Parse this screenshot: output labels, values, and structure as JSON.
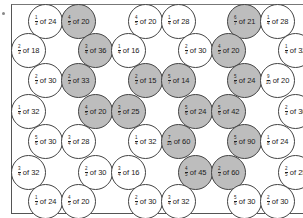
{
  "colors": {
    "shaded": "#bdbdbd",
    "border": "#444444",
    "text": "#222222"
  },
  "circles": [
    {
      "num": "1",
      "den": "3",
      "of": "of 24",
      "x": 28,
      "y": 4,
      "shaded": false
    },
    {
      "num": "4",
      "den": "5",
      "of": "of 20",
      "x": 61,
      "y": 4,
      "shaded": true
    },
    {
      "num": "4",
      "den": "5",
      "of": "of 20",
      "x": 128,
      "y": 4,
      "shaded": false
    },
    {
      "num": "1",
      "den": "4",
      "of": "of 28",
      "x": 161,
      "y": 4,
      "shaded": false
    },
    {
      "num": "6",
      "den": "7",
      "of": "of 21",
      "x": 227,
      "y": 4,
      "shaded": true
    },
    {
      "num": "1",
      "den": "4",
      "of": "of 28",
      "x": 260,
      "y": 4,
      "shaded": false
    },
    {
      "num": "2",
      "den": "3",
      "of": "of 18",
      "x": 11,
      "y": 33,
      "shaded": false
    },
    {
      "num": "3",
      "den": "4",
      "of": "of 36",
      "x": 78,
      "y": 33,
      "shaded": true
    },
    {
      "num": "1",
      "den": "4",
      "of": "of 16",
      "x": 111,
      "y": 33,
      "shaded": false
    },
    {
      "num": "2",
      "den": "3",
      "of": "of 30",
      "x": 178,
      "y": 33,
      "shaded": false
    },
    {
      "num": "4",
      "den": "5",
      "of": "of 20",
      "x": 211,
      "y": 33,
      "shaded": true
    },
    {
      "num": "1",
      "den": "4",
      "of": "of 32",
      "x": 278,
      "y": 33,
      "shaded": false
    },
    {
      "num": "2",
      "den": "3",
      "of": "of 30",
      "x": 28,
      "y": 63,
      "shaded": false
    },
    {
      "num": "2",
      "den": "3",
      "of": "of 33",
      "x": 61,
      "y": 63,
      "shaded": true
    },
    {
      "num": "2",
      "den": "3",
      "of": "of 15",
      "x": 128,
      "y": 63,
      "shaded": true
    },
    {
      "num": "5",
      "den": "7",
      "of": "of 14",
      "x": 161,
      "y": 63,
      "shaded": true
    },
    {
      "num": "5",
      "den": "6",
      "of": "of 24",
      "x": 227,
      "y": 63,
      "shaded": true
    },
    {
      "num": "9",
      "den": "10",
      "of": "of 20",
      "x": 260,
      "y": 63,
      "shaded": false
    },
    {
      "num": "1",
      "den": "4",
      "of": "of 32",
      "x": 11,
      "y": 94,
      "shaded": false
    },
    {
      "num": "4",
      "den": "5",
      "of": "of 20",
      "x": 78,
      "y": 94,
      "shaded": true
    },
    {
      "num": "3",
      "den": "5",
      "of": "of 25",
      "x": 111,
      "y": 94,
      "shaded": true
    },
    {
      "num": "5",
      "den": "6",
      "of": "of 24",
      "x": 178,
      "y": 94,
      "shaded": true
    },
    {
      "num": "5",
      "den": "6",
      "of": "of 42",
      "x": 211,
      "y": 94,
      "shaded": true
    },
    {
      "num": "2",
      "den": "3",
      "of": "of 30",
      "x": 278,
      "y": 94,
      "shaded": false
    },
    {
      "num": "5",
      "den": "6",
      "of": "of 30",
      "x": 28,
      "y": 124,
      "shaded": false
    },
    {
      "num": "3",
      "den": "4",
      "of": "of 28",
      "x": 61,
      "y": 124,
      "shaded": false
    },
    {
      "num": "1",
      "den": "4",
      "of": "of 32",
      "x": 128,
      "y": 124,
      "shaded": false
    },
    {
      "num": "7",
      "den": "10",
      "of": "of 60",
      "x": 161,
      "y": 124,
      "shaded": true
    },
    {
      "num": "5",
      "den": "6",
      "of": "of 90",
      "x": 227,
      "y": 124,
      "shaded": true
    },
    {
      "num": "1",
      "den": "8",
      "of": "of 24",
      "x": 260,
      "y": 124,
      "shaded": false
    },
    {
      "num": "3",
      "den": "4",
      "of": "of 32",
      "x": 11,
      "y": 155,
      "shaded": false
    },
    {
      "num": "2",
      "den": "3",
      "of": "of 30",
      "x": 78,
      "y": 155,
      "shaded": false
    },
    {
      "num": "3",
      "den": "4",
      "of": "of 16",
      "x": 111,
      "y": 155,
      "shaded": false
    },
    {
      "num": "4",
      "den": "5",
      "of": "of 45",
      "x": 178,
      "y": 155,
      "shaded": true
    },
    {
      "num": "2",
      "den": "3",
      "of": "of 60",
      "x": 211,
      "y": 155,
      "shaded": true
    },
    {
      "num": "2",
      "den": "5",
      "of": "of 25",
      "x": 278,
      "y": 155,
      "shaded": false
    },
    {
      "num": "1",
      "den": "3",
      "of": "of 24",
      "x": 28,
      "y": 184,
      "shaded": false
    },
    {
      "num": "4",
      "den": "5",
      "of": "of 20",
      "x": 61,
      "y": 184,
      "shaded": false
    },
    {
      "num": "2",
      "den": "3",
      "of": "of 30",
      "x": 128,
      "y": 184,
      "shaded": false
    },
    {
      "num": "3",
      "den": "4",
      "of": "of 32",
      "x": 161,
      "y": 184,
      "shaded": false
    },
    {
      "num": "5",
      "den": "6",
      "of": "of 30",
      "x": 227,
      "y": 184,
      "shaded": false
    },
    {
      "num": "2",
      "den": "3",
      "of": "of 30",
      "x": 260,
      "y": 184,
      "shaded": false
    }
  ]
}
